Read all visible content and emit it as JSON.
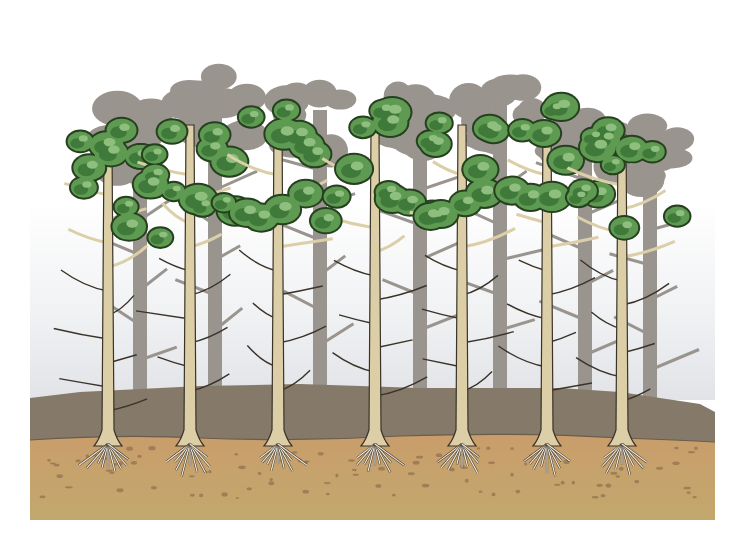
{
  "illustration": {
    "subject": "Pine forest stand cross-section with root systems",
    "foreground_tree_count": 7,
    "background_tree_count": 7,
    "colors": {
      "background": "#ffffff",
      "sky_haze": "#e6e7ea",
      "background_trees": "#9a948f",
      "foliage_dark": "#3f7a3a",
      "foliage_mid": "#5e9a52",
      "foliage_light": "#8fbf7e",
      "trunk": "#dccfa8",
      "trunk_outline": "#3b3328",
      "humus_layer": "#857a6a",
      "mineral_soil_top": "#c9a06e",
      "mineral_soil_bottom": "#c2a56c",
      "roots": "#efe9dc"
    },
    "layers": [
      "background trees",
      "foreground pine trees",
      "organic humus layer",
      "mineral soil with roots"
    ]
  }
}
